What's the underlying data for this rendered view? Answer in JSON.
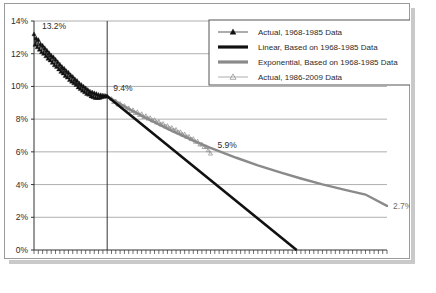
{
  "chart_data": {
    "type": "line",
    "title": "",
    "subtitle": "",
    "xlabel": "",
    "ylabel": "",
    "xlim": [
      1968,
      2050
    ],
    "ylim": [
      0,
      14
    ],
    "grid": true,
    "legend_position": "top-right",
    "y_ticks": [
      "0%",
      "2%",
      "4%",
      "6%",
      "8%",
      "10%",
      "12%",
      "14%"
    ],
    "y_tick_values": [
      0,
      2,
      4,
      6,
      8,
      10,
      12,
      14
    ],
    "x_ticks": [
      "1968",
      "1985",
      "2009",
      "2029",
      "2050"
    ],
    "x_tick_values": [
      1968,
      1985,
      2009,
      2029,
      2050
    ],
    "x_minor_tick_interval": 1,
    "reference_line_x": 1985,
    "annotations": [
      {
        "id": "start",
        "label": "13.2%",
        "x": 1968,
        "y": 13.2,
        "color": "#2b2b2b"
      },
      {
        "id": "mid",
        "label": "9.4%",
        "x": 1985,
        "y": 9.4,
        "color": "#2b2b2b"
      },
      {
        "id": "late",
        "label": "5.9%",
        "x": 2009,
        "y": 5.9,
        "color": "#2b2b2b"
      },
      {
        "id": "end",
        "label": "2.7%",
        "x": 2050,
        "y": 2.7,
        "color": "#6e6e6e"
      }
    ],
    "series": [
      {
        "name": "Actual, 1968-1985 Data",
        "key": "actual_early",
        "type": "line-marker",
        "marker": "triangle-filled",
        "color": "#111111",
        "x": [
          1968.0,
          1968.25,
          1968.5,
          1968.75,
          1969.0,
          1969.25,
          1969.5,
          1969.75,
          1970.0,
          1970.25,
          1970.5,
          1970.75,
          1971.0,
          1971.25,
          1971.5,
          1971.75,
          1972.0,
          1972.25,
          1972.5,
          1972.75,
          1973.0,
          1973.25,
          1973.5,
          1973.75,
          1974.0,
          1974.25,
          1974.5,
          1974.75,
          1975.0,
          1975.25,
          1975.5,
          1975.75,
          1976.0,
          1976.25,
          1976.5,
          1976.75,
          1977.0,
          1977.25,
          1977.5,
          1977.75,
          1978.0,
          1978.25,
          1978.5,
          1978.75,
          1979.0,
          1979.25,
          1979.5,
          1979.75,
          1980.0,
          1980.25,
          1980.5,
          1980.75,
          1981.0,
          1981.25,
          1981.5,
          1981.75,
          1982.0,
          1982.25,
          1982.5,
          1982.75,
          1983.0,
          1983.25,
          1983.5,
          1983.75,
          1984.0,
          1984.25,
          1984.5,
          1984.75,
          1985.0
        ],
        "y": [
          13.2,
          12.55,
          12.95,
          12.4,
          12.85,
          12.25,
          12.6,
          12.1,
          12.5,
          12.0,
          12.35,
          11.85,
          12.2,
          11.7,
          12.05,
          11.6,
          11.9,
          11.45,
          11.8,
          11.3,
          11.65,
          11.2,
          11.5,
          11.05,
          11.35,
          10.9,
          11.2,
          10.8,
          11.1,
          10.65,
          10.95,
          10.55,
          10.85,
          10.4,
          10.7,
          10.3,
          10.6,
          10.2,
          10.45,
          10.1,
          10.35,
          9.95,
          10.2,
          9.85,
          10.1,
          9.75,
          10.0,
          9.65,
          9.9,
          9.55,
          9.8,
          9.5,
          9.7,
          9.4,
          9.65,
          9.35,
          9.6,
          9.3,
          9.55,
          9.3,
          9.5,
          9.3,
          9.48,
          9.35,
          9.46,
          9.38,
          9.44,
          9.4,
          9.4
        ]
      },
      {
        "name": "Linear, Based on 1968-1985 Data",
        "key": "linear_trend",
        "type": "line",
        "color": "#111111",
        "x": [
          1985,
          2029
        ],
        "y": [
          9.4,
          0.0
        ]
      },
      {
        "name": "Exponential, Based on 1968-1985 Data",
        "key": "exponential_trend",
        "type": "line",
        "color": "#8a8a8a",
        "x": [
          1985,
          1990,
          1995,
          2000,
          2005,
          2009,
          2015,
          2020,
          2025,
          2030,
          2035,
          2040,
          2045,
          2050
        ],
        "y": [
          9.4,
          8.63,
          7.93,
          7.28,
          6.69,
          6.25,
          5.64,
          5.18,
          4.76,
          4.37,
          4.01,
          3.69,
          3.39,
          2.7
        ]
      },
      {
        "name": "Actual, 1986-2009 Data",
        "key": "actual_late",
        "type": "line-marker",
        "marker": "triangle-open",
        "color": "#8a8a8a",
        "x": [
          1986.0,
          1986.5,
          1987.0,
          1987.5,
          1988.0,
          1988.5,
          1989.0,
          1989.5,
          1990.0,
          1990.5,
          1991.0,
          1991.5,
          1992.0,
          1992.5,
          1993.0,
          1993.5,
          1994.0,
          1994.5,
          1995.0,
          1995.5,
          1996.0,
          1996.5,
          1997.0,
          1997.5,
          1998.0,
          1998.5,
          1999.0,
          1999.5,
          2000.0,
          2000.5,
          2001.0,
          2001.5,
          2002.0,
          2002.5,
          2003.0,
          2003.5,
          2004.0,
          2004.5,
          2005.0,
          2005.5,
          2006.0,
          2006.5,
          2007.0,
          2007.5,
          2008.0,
          2008.5,
          2009.0
        ],
        "y": [
          9.25,
          9.05,
          9.1,
          8.9,
          8.95,
          8.78,
          8.82,
          8.64,
          8.68,
          8.5,
          8.56,
          8.38,
          8.44,
          8.26,
          8.32,
          8.14,
          8.2,
          8.04,
          8.08,
          7.92,
          7.96,
          7.8,
          7.84,
          7.68,
          7.72,
          7.56,
          7.6,
          7.44,
          7.48,
          7.32,
          7.36,
          7.2,
          7.22,
          7.06,
          7.08,
          6.92,
          6.94,
          6.78,
          6.8,
          6.62,
          6.64,
          6.46,
          6.46,
          6.3,
          6.3,
          6.1,
          5.9
        ]
      }
    ]
  },
  "legend": {
    "entries": [
      {
        "label": "Actual, 1968-1985 Data",
        "marker": "triangle-filled-line",
        "color": "#111111"
      },
      {
        "label": "Linear, Based on 1968-1985 Data",
        "marker": "thick-line",
        "color": "#111111"
      },
      {
        "label": "Exponential, Based on 1968-1985 Data",
        "marker": "thick-line",
        "color": "#8a8a8a"
      },
      {
        "label": "Actual, 1986-2009 Data",
        "marker": "triangle-open-line",
        "color": "#8a8a8a"
      }
    ]
  },
  "colors": {
    "black_series": "#111111",
    "gray_series": "#8a8a8a",
    "gridline": "#9a9a9a",
    "axis": "#333333",
    "panel_border": "#9a9a9a",
    "shadow": "#c9c9c9",
    "background": "#ffffff"
  }
}
